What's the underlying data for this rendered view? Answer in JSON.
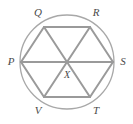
{
  "figure": {
    "type": "geometry-diagram",
    "background_color": "#ffffff",
    "stroke_color": "#9a9a9a",
    "circle_stroke_color": "#a8a8a8",
    "label_color": "#4a4a4a",
    "circle": {
      "center_x": 67,
      "center_y": 62,
      "radius": 47
    },
    "vertices": [
      {
        "id": "P",
        "label": "P",
        "cx": 21,
        "cy": 62,
        "label_x": 11,
        "label_y": 62
      },
      {
        "id": "Q",
        "label": "Q",
        "cx": 44,
        "cy": 27,
        "label_x": 38,
        "label_y": 13
      },
      {
        "id": "R",
        "label": "R",
        "cx": 90,
        "cy": 27,
        "label_x": 96,
        "label_y": 13
      },
      {
        "id": "S",
        "label": "S",
        "cx": 113,
        "cy": 62,
        "label_x": 123,
        "label_y": 62
      },
      {
        "id": "T",
        "label": "T",
        "cx": 90,
        "cy": 97,
        "label_x": 96,
        "label_y": 111
      },
      {
        "id": "V",
        "label": "V",
        "cx": 44,
        "cy": 97,
        "label_x": 38,
        "label_y": 111
      }
    ],
    "center_point": {
      "id": "X",
      "label": "X",
      "cx": 67,
      "cy": 62,
      "label_x": 67,
      "label_y": 76
    },
    "hexagon_edges": [
      {
        "from": "P",
        "to": "Q"
      },
      {
        "from": "Q",
        "to": "R"
      },
      {
        "from": "R",
        "to": "S"
      },
      {
        "from": "S",
        "to": "T"
      },
      {
        "from": "T",
        "to": "V"
      },
      {
        "from": "V",
        "to": "P"
      }
    ],
    "diagonals": [
      {
        "from": "P",
        "to": "S"
      },
      {
        "from": "Q",
        "to": "T"
      },
      {
        "from": "R",
        "to": "V"
      }
    ]
  }
}
